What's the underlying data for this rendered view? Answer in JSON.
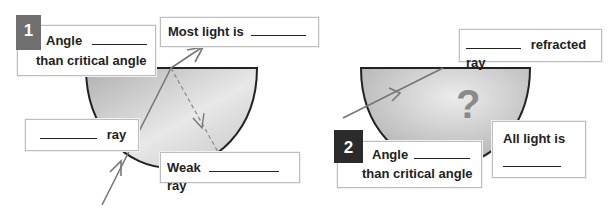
{
  "panel1": {
    "badge": "1",
    "angle_box": {
      "line1": "Angle",
      "line2": "than critical  angle"
    },
    "most_light_box": {
      "text": "Most light is"
    },
    "incident_box": {
      "text": "ray"
    },
    "weak_box": {
      "prefix": "Weak",
      "suffix": "ray"
    }
  },
  "panel2": {
    "badge": "2",
    "angle_box": {
      "line1": "Angle",
      "line2": "than critical angle"
    },
    "refracted_box": {
      "text": "refracted ray"
    },
    "all_light_box": {
      "text": "All light is"
    },
    "question_mark": "?"
  },
  "colors": {
    "glass_fill_light": "#e6e6e6",
    "glass_fill_dark": "#b4b4b4",
    "ray": "#777777",
    "outline": "#222222",
    "badge1": "#6f6f6f",
    "badge2": "#2b2b2b",
    "question": "#8a8a8a"
  }
}
